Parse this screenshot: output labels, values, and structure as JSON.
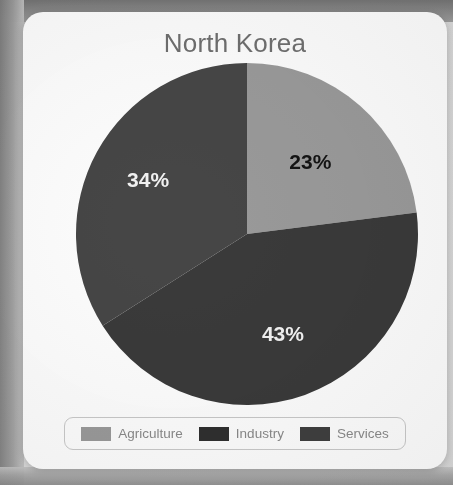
{
  "card": {
    "title": "North Korea"
  },
  "chart_data": {
    "type": "pie",
    "title": "North Korea",
    "xlabel": "",
    "ylabel": "",
    "legend_position": "bottom",
    "grid": false,
    "categories": [
      "Agriculture",
      "Industry",
      "Services"
    ],
    "values": [
      23,
      43,
      34
    ],
    "value_labels": [
      "23%",
      "43%",
      "34%"
    ],
    "colors": [
      "#9a9a9a",
      "#3a3a3a",
      "#464646"
    ],
    "label_colors": [
      "#141414",
      "#f2f2f2",
      "#f2f2f2"
    ],
    "start_angle_deg": 0,
    "direction": "clockwise",
    "slices": [
      {
        "name": "Agriculture",
        "value": 23,
        "label": "23%",
        "color": "#9a9a9a",
        "label_color": "#141414",
        "start_deg": 0,
        "end_deg": 82.8
      },
      {
        "name": "Industry",
        "value": 43,
        "label": "43%",
        "color": "#3a3a3a",
        "label_color": "#f2f2f2",
        "start_deg": 82.8,
        "end_deg": 237.6
      },
      {
        "name": "Services",
        "value": 34,
        "label": "34%",
        "color": "#464646",
        "label_color": "#f2f2f2",
        "start_deg": 237.6,
        "end_deg": 360
      }
    ]
  },
  "legend": {
    "items": [
      {
        "label": "Agriculture",
        "color": "#9a9a9a"
      },
      {
        "label": "Industry",
        "color": "#2f2f2f"
      },
      {
        "label": "Services",
        "color": "#3f3f3f"
      }
    ]
  }
}
